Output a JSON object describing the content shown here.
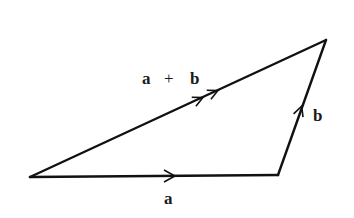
{
  "diagram": {
    "type": "vector-addition-triangle",
    "colors": {
      "stroke": "#111111",
      "background": "#ffffff",
      "text": "#1a1a1a"
    },
    "vertices": {
      "origin": [
        30,
        177
      ],
      "a_end": [
        278,
        175
      ],
      "b_end": [
        326,
        40
      ]
    },
    "vectors": [
      {
        "id": "a",
        "label": "a",
        "from": "origin",
        "to": "a_end",
        "arrowheads": 1
      },
      {
        "id": "b",
        "label": "b",
        "from": "a_end",
        "to": "b_end",
        "arrowheads": 1
      },
      {
        "id": "a_plus_b",
        "label": "a + b",
        "from": "origin",
        "to": "b_end",
        "arrowheads": 2
      }
    ],
    "labels": {
      "a": "a",
      "b": "b",
      "sum_a": "a",
      "sum_plus": "+",
      "sum_b": "b"
    }
  }
}
